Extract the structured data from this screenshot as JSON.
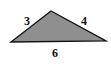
{
  "diagram": {
    "type": "triangle",
    "fill_color": "#8f8f8f",
    "stroke_color": "#111111",
    "sides": [
      {
        "name": "left",
        "label": "3"
      },
      {
        "name": "right",
        "label": "4"
      },
      {
        "name": "base",
        "label": "6"
      }
    ]
  }
}
